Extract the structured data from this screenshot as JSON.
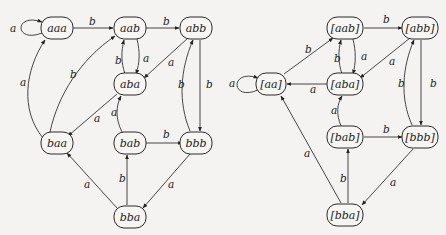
{
  "diagrams": [
    {
      "name": "original-automaton",
      "nodes": [
        {
          "id": "aaa",
          "label": "aaa",
          "x": 57,
          "y": 28,
          "w": 32
        },
        {
          "id": "aab",
          "label": "aab",
          "x": 130,
          "y": 28,
          "w": 32
        },
        {
          "id": "abb",
          "label": "abb",
          "x": 196,
          "y": 28,
          "w": 32
        },
        {
          "id": "aba",
          "label": "aba",
          "x": 130,
          "y": 84,
          "w": 32
        },
        {
          "id": "baa",
          "label": "baa",
          "x": 57,
          "y": 143,
          "w": 32
        },
        {
          "id": "bab",
          "label": "bab",
          "x": 130,
          "y": 143,
          "w": 32
        },
        {
          "id": "bbb",
          "label": "bbb",
          "x": 196,
          "y": 143,
          "w": 32
        },
        {
          "id": "bba",
          "label": "bba",
          "x": 130,
          "y": 217,
          "w": 32
        }
      ],
      "edges": [
        {
          "from": "aaa",
          "to": "aaa",
          "label": "a",
          "lx": 10,
          "ly": 32
        },
        {
          "from": "aaa",
          "to": "aab",
          "label": "b",
          "lx": 89,
          "ly": 25
        },
        {
          "from": "aab",
          "to": "abb",
          "label": "b",
          "lx": 163,
          "ly": 25
        },
        {
          "from": "aab",
          "to": "aba",
          "label": "a",
          "lx": 143,
          "ly": 62
        },
        {
          "from": "aba",
          "to": "aab",
          "label": "b",
          "lx": 115,
          "ly": 64
        },
        {
          "from": "abb",
          "to": "aba",
          "label": "a",
          "lx": 168,
          "ly": 66
        },
        {
          "from": "abb",
          "to": "bbb",
          "label": "b",
          "lx": 206,
          "ly": 88
        },
        {
          "from": "bbb",
          "to": "abb",
          "label": "b",
          "lx": 178,
          "ly": 88
        },
        {
          "from": "baa",
          "to": "aaa",
          "label": "a",
          "lx": 20,
          "ly": 86
        },
        {
          "from": "baa",
          "to": "aab",
          "label": "b",
          "lx": 70,
          "ly": 78
        },
        {
          "from": "aba",
          "to": "baa",
          "label": "a",
          "lx": 94,
          "ly": 122
        },
        {
          "from": "bab",
          "to": "aba",
          "label": "a",
          "lx": 111,
          "ly": 116
        },
        {
          "from": "bab",
          "to": "bbb",
          "label": "b",
          "lx": 163,
          "ly": 138
        },
        {
          "from": "bbb",
          "to": "bba",
          "label": "a",
          "lx": 168,
          "ly": 188
        },
        {
          "from": "bba",
          "to": "bab",
          "label": "b",
          "lx": 119,
          "ly": 182
        },
        {
          "from": "bba",
          "to": "baa",
          "label": "a",
          "lx": 84,
          "ly": 188
        }
      ]
    },
    {
      "name": "quotient-automaton",
      "nodes": [
        {
          "id": "aa",
          "label": "[aa]",
          "x": 271,
          "y": 84,
          "w": 30
        },
        {
          "id": "aab",
          "label": "[aab]",
          "x": 345,
          "y": 28,
          "w": 36
        },
        {
          "id": "abb",
          "label": "[abb]",
          "x": 420,
          "y": 28,
          "w": 36
        },
        {
          "id": "aba",
          "label": "[aba]",
          "x": 345,
          "y": 84,
          "w": 36
        },
        {
          "id": "bab",
          "label": "[bab]",
          "x": 345,
          "y": 137,
          "w": 36
        },
        {
          "id": "bbb",
          "label": "[bbb]",
          "x": 420,
          "y": 137,
          "w": 36
        },
        {
          "id": "bba",
          "label": "[bba]",
          "x": 345,
          "y": 215,
          "w": 36
        }
      ],
      "edges": [
        {
          "from": "aa",
          "to": "aa",
          "label": "a",
          "lx": 229,
          "ly": 87
        },
        {
          "from": "aa",
          "to": "aab",
          "label": "b",
          "lx": 305,
          "ly": 53
        },
        {
          "from": "aab",
          "to": "abb",
          "label": "b",
          "lx": 383,
          "ly": 23
        },
        {
          "from": "aab",
          "to": "aba",
          "label": "a",
          "lx": 361,
          "ly": 60
        },
        {
          "from": "aba",
          "to": "aab",
          "label": "b",
          "lx": 334,
          "ly": 62
        },
        {
          "from": "abb",
          "to": "aba",
          "label": "a",
          "lx": 389,
          "ly": 65
        },
        {
          "from": "aba",
          "to": "aa",
          "label": "a",
          "lx": 310,
          "ly": 93
        },
        {
          "from": "abb",
          "to": "bbb",
          "label": "b",
          "lx": 430,
          "ly": 87
        },
        {
          "from": "bbb",
          "to": "abb",
          "label": "b",
          "lx": 398,
          "ly": 87
        },
        {
          "from": "bab",
          "to": "aba",
          "label": "a",
          "lx": 331,
          "ly": 114
        },
        {
          "from": "bab",
          "to": "bbb",
          "label": "b",
          "lx": 383,
          "ly": 133
        },
        {
          "from": "bbb",
          "to": "bba",
          "label": "a",
          "lx": 390,
          "ly": 186
        },
        {
          "from": "bba",
          "to": "bab",
          "label": "b",
          "lx": 340,
          "ly": 182
        },
        {
          "from": "bba",
          "to": "aa",
          "label": "a",
          "lx": 304,
          "ly": 157
        }
      ]
    }
  ]
}
